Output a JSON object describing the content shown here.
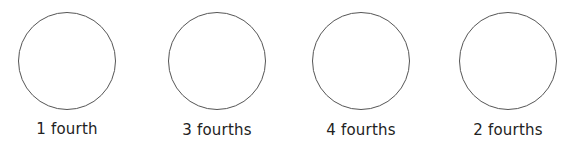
{
  "items": [
    {
      "label": "1 fourth",
      "cx": 67,
      "cy": 61,
      "r": 49
    },
    {
      "label": "3 fourths",
      "cx": 217,
      "cy": 61,
      "r": 49
    },
    {
      "label": "4 fourths",
      "cx": 361,
      "cy": 61,
      "r": 49
    },
    {
      "label": "2 fourths",
      "cx": 508,
      "cy": 61,
      "r": 49
    }
  ],
  "colors": {
    "stroke": "#555555",
    "text": "#222222"
  }
}
